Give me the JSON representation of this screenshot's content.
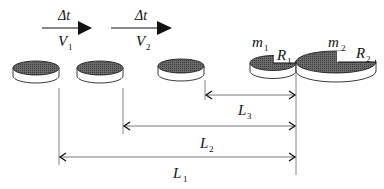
{
  "diagram": {
    "velocity_arrows": [
      {
        "top": "Δt",
        "bottom_main": "V",
        "bottom_sub": "1"
      },
      {
        "top": "Δt",
        "bottom_main": "V",
        "bottom_sub": "2"
      }
    ],
    "pucks": [
      {
        "label": "puck-position-1"
      },
      {
        "label": "puck-position-2"
      },
      {
        "label": "puck-position-3"
      }
    ],
    "puck_m1": {
      "mass_main": "m",
      "mass_sub": "1",
      "radius_main": "R",
      "radius_sub": "1"
    },
    "puck_m2": {
      "mass_main": "m",
      "mass_sub": "2",
      "radius_main": "R",
      "radius_sub": "2"
    },
    "distances": [
      {
        "main": "L",
        "sub": "3"
      },
      {
        "main": "L",
        "sub": "2"
      },
      {
        "main": "L",
        "sub": "1"
      }
    ],
    "colors": {
      "line": "#222222",
      "dim_line": "#555555",
      "puck_top": "#5a5a5a",
      "puck_side": "#ffffff"
    }
  }
}
